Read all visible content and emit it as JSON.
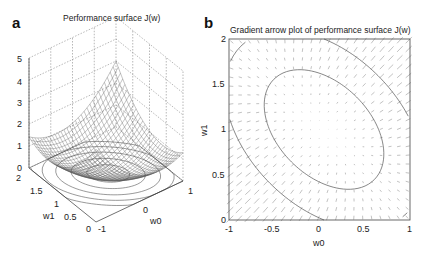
{
  "panels": {
    "a": {
      "label": "a",
      "title": "Performance surface J(w)",
      "z_ticks": [
        "0",
        "1",
        "2",
        "3",
        "4",
        "5"
      ],
      "w1_ticks": [
        "2",
        "1.5",
        "1",
        "0.5",
        "0"
      ],
      "w0_ticks": [
        "-1",
        "0",
        "1"
      ],
      "xlabel": "w0",
      "ylabel": "w1"
    },
    "b": {
      "label": "b",
      "title": "Gradient arrow plot of performance surface J(w)",
      "x_ticks": [
        "-1",
        "-0.5",
        "0",
        "0.5",
        "1"
      ],
      "y_ticks": [
        "0",
        "0.5",
        "1",
        "1.5",
        "2"
      ],
      "xlabel": "w0",
      "ylabel": "w1"
    }
  },
  "chart_data": [
    {
      "type": "surface",
      "title": "Performance surface J(w)",
      "xlabel": "w0",
      "ylabel": "w1",
      "zlabel": "",
      "xlim": [
        -1,
        1
      ],
      "ylim": [
        0,
        2
      ],
      "zlim": [
        0,
        5
      ],
      "x_ticks": [
        -1,
        0,
        1
      ],
      "y_ticks": [
        0,
        0.5,
        1,
        1.5,
        2
      ],
      "z_ticks": [
        0,
        1,
        2,
        3,
        4,
        5
      ],
      "description": "Quadratic bowl mesh surface with minimum near w0≈0, w1≈1; max ≈4.3 at corner (w0=-1,w1=0); elliptical contours projected on floor",
      "grid": true
    },
    {
      "type": "quiver",
      "title": "Gradient arrow plot of performance surface J(w)",
      "xlabel": "w0",
      "ylabel": "w1",
      "xlim": [
        -1,
        1
      ],
      "ylim": [
        0,
        2
      ],
      "x_ticks": [
        -1,
        -0.5,
        0,
        0.5,
        1
      ],
      "y_ticks": [
        0,
        0.5,
        1,
        1.5,
        2
      ],
      "description": "Grid of gradient arrows (larger near corners w0=-1,w1=0 and w0=1,w1=2, near-zero around center ≈(0.05,1.0)); two tilted elliptical contour lines",
      "contours": [
        {
          "level": "inner",
          "approx_extent": {
            "w0": [
              -0.6,
              0.75
            ],
            "w1": [
              0.35,
              1.7
            ]
          }
        },
        {
          "level": "outer",
          "approx_extent": {
            "w0": [
              -1.0,
              1.0
            ],
            "w1": [
              0.05,
              2.0
            ]
          }
        }
      ],
      "grid": false
    }
  ]
}
